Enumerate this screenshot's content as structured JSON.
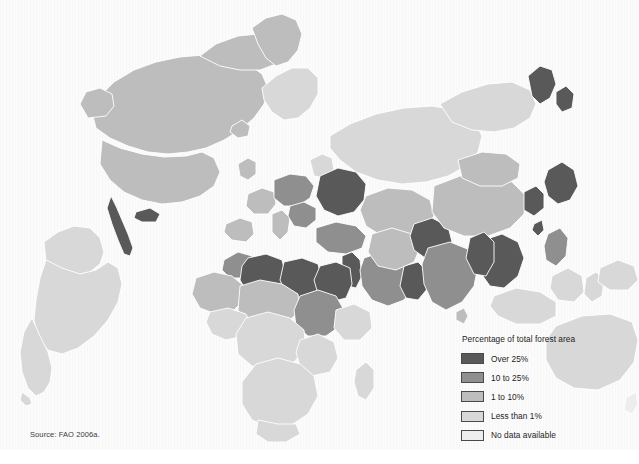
{
  "figure": {
    "type": "choropleth-map",
    "source_note": "Source: FAO 2006a.",
    "background_color": "#fbfbfb",
    "border_color": "#ffffff"
  },
  "legend": {
    "title": "Percentage of total forest area",
    "position": "bottom-right",
    "items": [
      {
        "label": "Over 25%",
        "color": "#595959",
        "class": "c-over25"
      },
      {
        "label": "10 to 25%",
        "color": "#8f8f8f",
        "class": "c-10to25"
      },
      {
        "label": "1 to 10%",
        "color": "#bdbdbd",
        "class": "c-1to10"
      },
      {
        "label": "Less than 1%",
        "color": "#d8d8d8",
        "class": "c-under1"
      },
      {
        "label": "No data available",
        "color": "#ededed",
        "class": "c-nodata"
      }
    ]
  },
  "map_data": {
    "type": "choropleth",
    "variable": "Percentage of total forest area",
    "projection": "oblique / rotated globe view",
    "categories": [
      "Over 25%",
      "10 to 25%",
      "1 to 10%",
      "Less than 1%",
      "No data available"
    ],
    "regions": [
      {
        "name": "North America (Canada / USA / Greenland)",
        "category": "1 to 10%"
      },
      {
        "name": "Central America",
        "category": "Over 25%"
      },
      {
        "name": "South America",
        "category": "Less than 1%"
      },
      {
        "name": "Northern Europe / Scandinavia",
        "category": "Less than 1%"
      },
      {
        "name": "Western Europe",
        "category": "1 to 10%"
      },
      {
        "name": "Central & Eastern Europe",
        "category": "10 to 25%"
      },
      {
        "name": "Russian Federation",
        "category": "Less than 1%"
      },
      {
        "name": "Ukraine / Belarus region",
        "category": "Over 25%"
      },
      {
        "name": "Turkey",
        "category": "10 to 25%"
      },
      {
        "name": "Morocco",
        "category": "10 to 25%"
      },
      {
        "name": "Algeria",
        "category": "Over 25%"
      },
      {
        "name": "Libya",
        "category": "Over 25%"
      },
      {
        "name": "Egypt",
        "category": "Over 25%"
      },
      {
        "name": "Levant / Israel / Lebanon",
        "category": "Over 25%"
      },
      {
        "name": "Arabian Peninsula",
        "category": "10 to 25%"
      },
      {
        "name": "Oman / Yemen coast",
        "category": "Over 25%"
      },
      {
        "name": "Sahel belt",
        "category": "1 to 10%"
      },
      {
        "name": "Sudan region",
        "category": "10 to 25%"
      },
      {
        "name": "West Africa",
        "category": "1 to 10%"
      },
      {
        "name": "Central & Southern Africa",
        "category": "Less than 1%"
      },
      {
        "name": "Madagascar",
        "category": "Less than 1%"
      },
      {
        "name": "Central Asia",
        "category": "1 to 10%"
      },
      {
        "name": "Iran",
        "category": "1 to 10%"
      },
      {
        "name": "South Asia / India",
        "category": "10 to 25%"
      },
      {
        "name": "Pakistan / Afghanistan",
        "category": "Over 25%"
      },
      {
        "name": "China",
        "category": "1 to 10%"
      },
      {
        "name": "Mongolia",
        "category": "1 to 10%"
      },
      {
        "name": "Korean peninsula",
        "category": "Over 25%"
      },
      {
        "name": "Japan",
        "category": "Over 25%"
      },
      {
        "name": "Indochina / Thailand",
        "category": "Over 25%"
      },
      {
        "name": "Philippines",
        "category": "10 to 25%"
      },
      {
        "name": "Indonesia",
        "category": "Less than 1%"
      },
      {
        "name": "Papua New Guinea",
        "category": "Less than 1%"
      },
      {
        "name": "Australia",
        "category": "Less than 1%"
      },
      {
        "name": "New Zealand",
        "category": "No data available"
      }
    ]
  }
}
